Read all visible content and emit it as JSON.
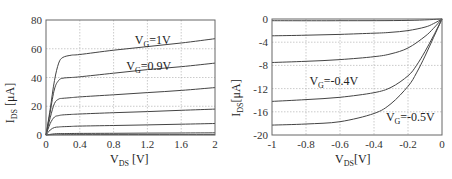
{
  "chart_data": [
    {
      "type": "line",
      "title": "",
      "xlabel": "V_DS [V]",
      "ylabel": "I_DS [μA]",
      "xlim": [
        0,
        2
      ],
      "ylim": [
        0,
        80
      ],
      "xticks": [
        "0",
        "0.4",
        "0.8",
        "1.2",
        "1.6",
        "2"
      ],
      "yticks": [
        "0",
        "20",
        "40",
        "60",
        "80"
      ],
      "grid": true,
      "annotations": [
        {
          "text": "V_G=1V",
          "x": 1.05,
          "y": 63
        },
        {
          "text": "V_G=0.9V",
          "x": 0.95,
          "y": 45
        }
      ],
      "series": [
        {
          "name": "V_G=1V",
          "x": [
            0,
            0.05,
            0.1,
            0.15,
            0.2,
            0.3,
            0.4,
            0.8,
            1.2,
            1.6,
            2.0
          ],
          "y": [
            0,
            18,
            38,
            50,
            54,
            55.5,
            56,
            59,
            61.5,
            64,
            67
          ]
        },
        {
          "name": "V_G=0.9V",
          "x": [
            0,
            0.05,
            0.1,
            0.15,
            0.2,
            0.3,
            0.4,
            0.8,
            1.2,
            1.6,
            2.0
          ],
          "y": [
            0,
            16,
            32,
            38,
            39.5,
            40,
            40.5,
            43,
            45.5,
            47.5,
            50
          ]
        },
        {
          "name": "V_G=0.8V",
          "x": [
            0,
            0.05,
            0.1,
            0.15,
            0.2,
            0.3,
            0.4,
            0.8,
            1.2,
            1.6,
            2.0
          ],
          "y": [
            0,
            12,
            22,
            25,
            25.5,
            26,
            26.5,
            28,
            29.5,
            31,
            33
          ]
        },
        {
          "name": "V_G=0.7V",
          "x": [
            0,
            0.05,
            0.1,
            0.15,
            0.2,
            0.3,
            0.4,
            0.8,
            1.2,
            1.6,
            2.0
          ],
          "y": [
            0,
            8,
            12.5,
            13.5,
            14,
            14.3,
            14.6,
            15.5,
            16.3,
            17.2,
            18
          ]
        },
        {
          "name": "V_G=0.6V",
          "x": [
            0,
            0.05,
            0.1,
            0.15,
            0.2,
            0.3,
            0.4,
            0.8,
            1.2,
            1.6,
            2.0
          ],
          "y": [
            0,
            3.5,
            5.2,
            5.6,
            5.8,
            6,
            6.2,
            6.6,
            7,
            7.5,
            8
          ]
        },
        {
          "name": "V_G=0.5V",
          "x": [
            0,
            0.1,
            0.2,
            0.4,
            0.8,
            1.2,
            1.6,
            2.0
          ],
          "y": [
            0,
            0.8,
            1,
            1.1,
            1.2,
            1.3,
            1.4,
            1.5
          ]
        },
        {
          "name": "V_G=0.4V",
          "x": [
            0,
            0.1,
            0.4,
            2.0
          ],
          "y": [
            0,
            0.2,
            0.25,
            0.3
          ]
        }
      ]
    },
    {
      "type": "line",
      "title": "",
      "xlabel": "V_DS[V]",
      "ylabel": "I_DS[μA]",
      "xlim": [
        -1,
        0
      ],
      "ylim": [
        -20,
        0
      ],
      "xticks": [
        "-1",
        "-0.8",
        "-0.6",
        "-0.4",
        "-0.2",
        "0"
      ],
      "yticks": [
        "0",
        "-4",
        "-8",
        "-12",
        "-16",
        "-20"
      ],
      "grid": true,
      "annotations": [
        {
          "text": "V_G=-0.4V",
          "x": -0.78,
          "y": -11.3
        },
        {
          "text": "V_G=-0.5V",
          "x": -0.33,
          "y": -17.5
        }
      ],
      "series": [
        {
          "name": "V_G=-0.1V",
          "x": [
            -1,
            -0.6,
            -0.2,
            0
          ],
          "y": [
            -0.3,
            -0.3,
            -0.25,
            0
          ]
        },
        {
          "name": "V_G=-0.2V",
          "x": [
            -1,
            -0.8,
            -0.6,
            -0.4,
            -0.3,
            -0.2,
            -0.1,
            -0.05,
            0
          ],
          "y": [
            -2.9,
            -2.8,
            -2.65,
            -2.45,
            -2.3,
            -2.0,
            -1.4,
            -0.8,
            0
          ]
        },
        {
          "name": "V_G=-0.3V",
          "x": [
            -1,
            -0.8,
            -0.6,
            -0.4,
            -0.3,
            -0.2,
            -0.1,
            -0.05,
            0
          ],
          "y": [
            -7.5,
            -7.3,
            -7.0,
            -6.5,
            -6.0,
            -5.0,
            -3.0,
            -1.6,
            0
          ]
        },
        {
          "name": "V_G=-0.4V",
          "x": [
            -1,
            -0.8,
            -0.6,
            -0.4,
            -0.3,
            -0.2,
            -0.15,
            -0.1,
            -0.05,
            0
          ],
          "y": [
            -14.2,
            -13.9,
            -13.5,
            -12.7,
            -11.8,
            -9.8,
            -8.0,
            -5.6,
            -2.9,
            0
          ]
        },
        {
          "name": "V_G=-0.5V",
          "x": [
            -1,
            -0.8,
            -0.6,
            -0.4,
            -0.3,
            -0.2,
            -0.15,
            -0.1,
            -0.05,
            0
          ],
          "y": [
            -18.3,
            -18.1,
            -17.7,
            -16.3,
            -14.6,
            -11.6,
            -9.3,
            -6.4,
            -3.2,
            0
          ]
        }
      ]
    }
  ]
}
